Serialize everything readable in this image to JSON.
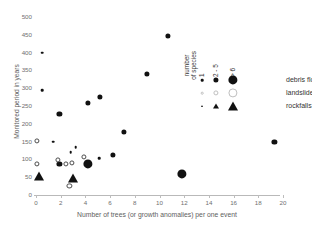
{
  "chart_data": {
    "type": "scatter",
    "title": "",
    "xlabel": "Number of trees (or growth anomalies) per one event",
    "ylabel": "Monitored period in years",
    "xlim": [
      0,
      21
    ],
    "ylim": [
      -10,
      510
    ],
    "xticks": [
      0,
      2,
      4,
      6,
      8,
      10,
      12,
      14,
      16,
      18,
      20
    ],
    "xtick_labels": [
      "0",
      "2",
      "4",
      "6",
      "8",
      "10",
      "12",
      "14",
      "16",
      "18",
      "20"
    ],
    "yticks": [
      0,
      50,
      100,
      150,
      200,
      250,
      300,
      350,
      400,
      450,
      500
    ],
    "ytick_labels": [
      "0",
      "50",
      "100",
      "150",
      "200",
      "250",
      "300",
      "350",
      "400",
      "450",
      "500"
    ],
    "grid": false,
    "legend_position": "upper-right-inside",
    "size_encoding": {
      "title": "number\nof species",
      "levels": [
        "1",
        "2 - 5",
        "> 6"
      ],
      "radii_px": [
        1.3,
        2.6,
        4.6
      ]
    },
    "series": [
      {
        "name": "debris flows",
        "marker": "filled-circle",
        "color": "#111111",
        "points": [
          {
            "x": 0.5,
            "y": 400,
            "size": 1
          },
          {
            "x": 0.5,
            "y": 295,
            "size": 1
          },
          {
            "x": 1.4,
            "y": 150,
            "size": 1
          },
          {
            "x": 1.9,
            "y": 228,
            "size": 2
          },
          {
            "x": 1.9,
            "y": 88,
            "size": 2
          },
          {
            "x": 2.8,
            "y": 120,
            "size": 1
          },
          {
            "x": 3.2,
            "y": 135,
            "size": 1
          },
          {
            "x": 4.2,
            "y": 88,
            "size": 3
          },
          {
            "x": 4.2,
            "y": 258,
            "size": 2
          },
          {
            "x": 5.1,
            "y": 103,
            "size": 1
          },
          {
            "x": 5.2,
            "y": 276,
            "size": 2
          },
          {
            "x": 6.2,
            "y": 112,
            "size": 2
          },
          {
            "x": 7.1,
            "y": 178,
            "size": 2
          },
          {
            "x": 9.0,
            "y": 340,
            "size": 2
          },
          {
            "x": 10.7,
            "y": 447,
            "size": 2
          },
          {
            "x": 11.8,
            "y": 60,
            "size": 3
          },
          {
            "x": 19.3,
            "y": 150,
            "size": 2
          }
        ]
      },
      {
        "name": "landslides",
        "marker": "open-circle",
        "color": "#4a4a4a",
        "points": [
          {
            "x": 0.1,
            "y": 152,
            "size": 2
          },
          {
            "x": 0.1,
            "y": 88,
            "size": 2
          },
          {
            "x": 1.8,
            "y": 99,
            "size": 2
          },
          {
            "x": 2.4,
            "y": 88,
            "size": 2
          },
          {
            "x": 2.7,
            "y": 25,
            "size": 2
          },
          {
            "x": 2.9,
            "y": 90,
            "size": 2
          },
          {
            "x": 3.9,
            "y": 108,
            "size": 2
          }
        ]
      },
      {
        "name": "rockfalls",
        "marker": "filled-triangle",
        "color": "#111111",
        "points": [
          {
            "x": 0.25,
            "y": 52,
            "size": 3
          },
          {
            "x": 3.0,
            "y": 48,
            "size": 3
          }
        ]
      }
    ]
  },
  "legend": {
    "size_title": "number\nof species",
    "col_labels": [
      "1",
      "2 - 5",
      "> 6"
    ],
    "rows": [
      {
        "label": "debris flows",
        "marker": "filled-circle"
      },
      {
        "label": "landslides",
        "marker": "open-circle"
      },
      {
        "label": "rockfalls",
        "marker": "filled-triangle"
      }
    ]
  },
  "axes": {
    "x_title": "Number of trees (or growth anomalies) per one event",
    "y_title": "Monitored period in years"
  }
}
